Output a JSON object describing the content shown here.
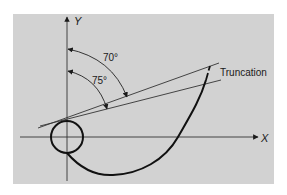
{
  "diagram": {
    "type": "geometric-construction",
    "axes": {
      "x_label": "X",
      "y_label": "Y"
    },
    "angles": [
      {
        "label": "70°",
        "value_deg": 70,
        "measured_from": "Y axis"
      },
      {
        "label": "75°",
        "value_deg": 75,
        "measured_from": "Y axis"
      }
    ],
    "annotation": "Truncation",
    "elements": [
      "circle at origin",
      "spiral-like curve from circle",
      "two tangent lines",
      "truncation mark"
    ],
    "colors": {
      "background": "#ffffff",
      "panel": "#d2d2d2",
      "stroke": "#1a1a1a"
    }
  }
}
